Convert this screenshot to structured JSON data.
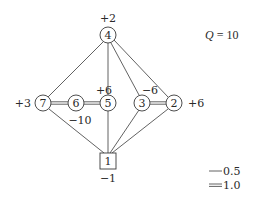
{
  "diagram": {
    "q_label": "Q = 10",
    "q_var": "Q",
    "q_eq": " = 10",
    "nodes": [
      {
        "id": "4",
        "shape": "circle",
        "cx": 108,
        "cy": 35,
        "charge": "+2",
        "charge_pos": [
          108,
          20
        ]
      },
      {
        "id": "7",
        "shape": "circle",
        "cx": 43,
        "cy": 103,
        "charge": "+3",
        "charge_pos": [
          22,
          107
        ]
      },
      {
        "id": "6",
        "shape": "circle",
        "cx": 76,
        "cy": 103,
        "charge": "−10",
        "charge_pos": [
          80,
          124
        ]
      },
      {
        "id": "5",
        "shape": "circle",
        "cx": 108,
        "cy": 103,
        "charge": "+6",
        "charge_pos": [
          103,
          92
        ]
      },
      {
        "id": "3",
        "shape": "circle",
        "cx": 142,
        "cy": 103,
        "charge": "−6",
        "charge_pos": [
          150,
          92
        ]
      },
      {
        "id": "2",
        "shape": "circle",
        "cx": 174,
        "cy": 103,
        "charge": "+6",
        "charge_pos": [
          198,
          107
        ]
      },
      {
        "id": "1",
        "shape": "square",
        "cx": 108,
        "cy": 161,
        "charge": "−1",
        "charge_pos": [
          108,
          182
        ]
      }
    ],
    "edges": [
      {
        "from": "4",
        "to": "7",
        "weight": 0.5
      },
      {
        "from": "4",
        "to": "5",
        "weight": 0.5
      },
      {
        "from": "4",
        "to": "3",
        "weight": 0.5
      },
      {
        "from": "4",
        "to": "2",
        "weight": 0.5
      },
      {
        "from": "7",
        "to": "6",
        "weight": 1.0
      },
      {
        "from": "6",
        "to": "5",
        "weight": 1.0
      },
      {
        "from": "3",
        "to": "2",
        "weight": 1.0
      },
      {
        "from": "7",
        "to": "1",
        "weight": 0.5
      },
      {
        "from": "5",
        "to": "1",
        "weight": 0.5
      },
      {
        "from": "3",
        "to": "1",
        "weight": 0.5
      },
      {
        "from": "2",
        "to": "1",
        "weight": 0.5
      }
    ],
    "legend": [
      {
        "style": "single-line",
        "label": "0.5"
      },
      {
        "style": "double-line",
        "label": "1.0"
      }
    ]
  }
}
